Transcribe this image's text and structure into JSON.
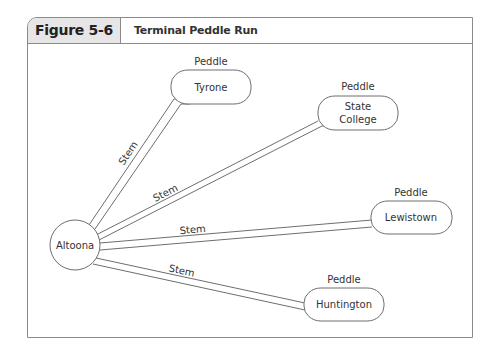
{
  "figure": {
    "number": "Figure 5-6",
    "title": "Terminal Peddle Run"
  },
  "diagram": {
    "hub": {
      "label": "Altoona",
      "cx": 75,
      "cy": 245,
      "r": 25
    },
    "edge_label": "Stem",
    "node_caption": "Peddle",
    "nodes": [
      {
        "id": "tyrone",
        "lines": [
          "Tyrone"
        ],
        "caption": "Peddle"
      },
      {
        "id": "state-college",
        "lines": [
          "State",
          "College"
        ],
        "caption": "Peddle"
      },
      {
        "id": "lewistown",
        "lines": [
          "Lewistown"
        ],
        "caption": "Peddle"
      },
      {
        "id": "huntington",
        "lines": [
          "Huntington"
        ],
        "caption": "Peddle"
      }
    ],
    "edges": [
      {
        "from": "Altoona",
        "to": "Tyrone",
        "label": "Stem"
      },
      {
        "from": "Altoona",
        "to": "State College",
        "label": "Stem"
      },
      {
        "from": "Altoona",
        "to": "Lewistown",
        "label": "Stem"
      },
      {
        "from": "Altoona",
        "to": "Huntington",
        "label": "Stem"
      }
    ]
  }
}
